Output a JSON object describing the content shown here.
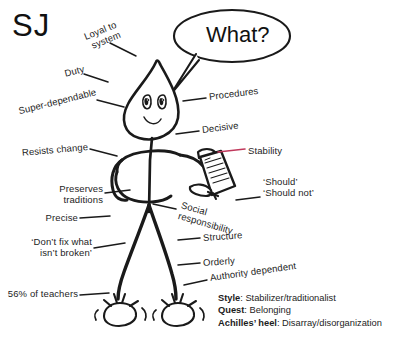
{
  "title": "SJ",
  "speech_bubble": {
    "text": "What?"
  },
  "labels_left": [
    {
      "id": "loyal-to-system",
      "text": "Loyal to\nsystem",
      "rotate": -22
    },
    {
      "id": "duty",
      "text": "Duty",
      "rotate": -14
    },
    {
      "id": "super-dependable",
      "text": "Super-dependable",
      "rotate": -14
    },
    {
      "id": "resists-change",
      "text": "Resists change",
      "rotate": -5
    },
    {
      "id": "preserves-traditions",
      "text": "Preserves\ntraditions",
      "rotate": 0
    },
    {
      "id": "precise",
      "text": "Precise",
      "rotate": 0
    },
    {
      "id": "dont-fix-what-isnt-broken",
      "text": "‘Don’t fix what\nisn’t broken’",
      "rotate": 0
    },
    {
      "id": "56-percent-of-teachers",
      "text": "56% of teachers",
      "rotate": 0
    }
  ],
  "labels_right": [
    {
      "id": "procedures",
      "text": "Procedures",
      "rotate": -7
    },
    {
      "id": "decisive",
      "text": "Decisive",
      "rotate": -7
    },
    {
      "id": "stability",
      "text": "Stability",
      "rotate": 0
    },
    {
      "id": "should-should-not",
      "text": "‘Should’\n‘Should not’",
      "rotate": 0
    },
    {
      "id": "social-responsibility",
      "text": "Social\nresponsibility",
      "rotate": 16
    },
    {
      "id": "structure",
      "text": "Structure",
      "rotate": -4
    },
    {
      "id": "orderly",
      "text": "Orderly",
      "rotate": -4
    },
    {
      "id": "authority-dependent",
      "text": "Authority dependent",
      "rotate": -8
    }
  ],
  "legend": {
    "style_key": "Style",
    "style_value": ": Stabilizer/traditionalist",
    "quest_key": "Quest",
    "quest_value": ": Belonging",
    "achilles_key": "Achilles’ heel",
    "achilles_value": ": Disarray/disorganization"
  },
  "colors": {
    "ink": "#1a1a1a",
    "paper": "#ffffff",
    "stability_leader": "#c0395c"
  }
}
